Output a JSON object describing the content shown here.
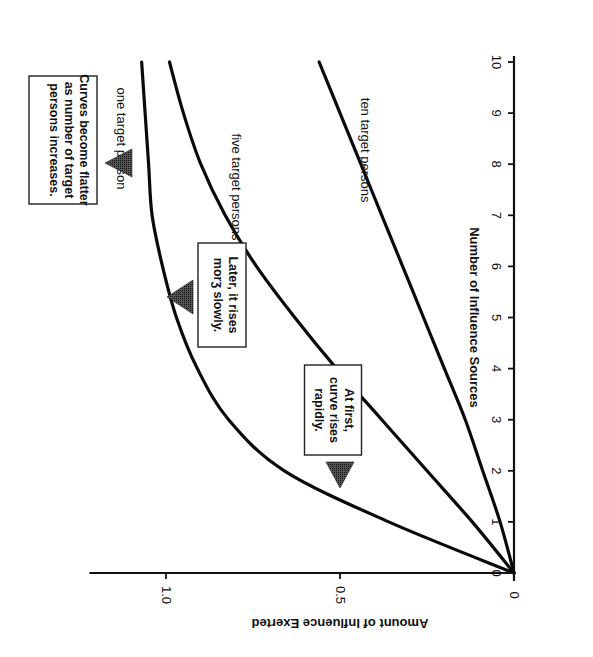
{
  "chart_data": {
    "type": "line",
    "orientation": "rotated 90° clockwise on page",
    "title": "",
    "xlabel": "Number of Influence Sources",
    "ylabel": "Amount of Influence Exerted",
    "x_ticks": [
      "0",
      "1",
      "2",
      "3",
      "4",
      "5",
      "6",
      "7",
      "8",
      "9",
      "10"
    ],
    "y_ticks": [
      "0",
      "0.5",
      "1.0"
    ],
    "xlim": [
      0,
      10
    ],
    "ylim": [
      0,
      1.2
    ],
    "grid": false,
    "legend": "inline curve labels",
    "x": [
      0,
      1,
      2,
      3,
      4,
      5,
      6,
      7,
      8,
      9,
      10
    ],
    "series": [
      {
        "name": "one target person",
        "values": [
          0,
          0.36,
          0.66,
          0.82,
          0.91,
          0.97,
          1.01,
          1.04,
          1.05,
          1.06,
          1.07
        ]
      },
      {
        "name": "five target persons",
        "values": [
          0,
          0.12,
          0.25,
          0.38,
          0.51,
          0.63,
          0.74,
          0.83,
          0.9,
          0.95,
          0.99
        ]
      },
      {
        "name": "ten target persons",
        "values": [
          0,
          0.04,
          0.09,
          0.14,
          0.2,
          0.26,
          0.32,
          0.38,
          0.44,
          0.5,
          0.56
        ]
      }
    ],
    "annotations": [
      {
        "text": "At first, curve rises rapidly.",
        "points_to": "one target person curve near x≈1.6"
      },
      {
        "text": "Later, it rises more slowly.",
        "points_to": "one target person curve near x≈5.3"
      },
      {
        "text": "Curves become flatter as number of target persons increases.",
        "points_to": "one target person curve near x≈8.3"
      }
    ]
  },
  "axes": {
    "x_title": "Number of Influence Sources",
    "y_title": "Amount of Influence Exerted",
    "x_ticks": [
      "0",
      "1",
      "2",
      "3",
      "4",
      "5",
      "6",
      "7",
      "8",
      "9",
      "10"
    ],
    "y_ticks": [
      "0",
      "0.5",
      "1.0"
    ],
    "origin_label": "0"
  },
  "labels": {
    "one": "one target person",
    "five": "five target persons",
    "ten": "ten target persons"
  },
  "notes": {
    "first": [
      "At first,",
      "curve rises",
      "rapidly."
    ],
    "later": [
      "Later, it rises",
      "mor e slowly."
    ],
    "flatter": [
      "Curves become flatter",
      "as number of target",
      "persons increases."
    ]
  }
}
